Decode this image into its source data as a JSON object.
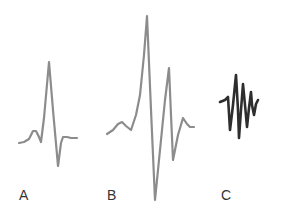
{
  "figure": {
    "panels": [
      {
        "label": "A",
        "stroke": "#8c8c8c",
        "stroke_width": 2.2,
        "points": "19,143 24,142 29,139 33,131 36,131 39,137 41,142 44,118 49,62 53,110 58,166 61,143 63,137 67,137 71,138 77,138"
      },
      {
        "label": "B",
        "stroke": "#8c8c8c",
        "stroke_width": 2.2,
        "points": "107,134 113,130 118,124 122,122 126,126 131,130 136,115 140,95 144,55 147,16 151,110 155,200 160,150 165,100 169,68 171,115 173,160 178,135 183,118 187,124 190,127 194,127"
      },
      {
        "label": "C",
        "stroke": "#2e2e2e",
        "stroke_width": 2.6,
        "points": "220,102 225,100 228,97 230,130 233,105 236,75 238,110 239,138 241,110 243,84 245,105 247,127 249,108 251,92 252,105 254,115 256,104 258,100"
      }
    ],
    "labels": [
      {
        "text": "A",
        "x": 19
      },
      {
        "text": "B",
        "x": 107
      },
      {
        "text": "C",
        "x": 221
      }
    ]
  }
}
